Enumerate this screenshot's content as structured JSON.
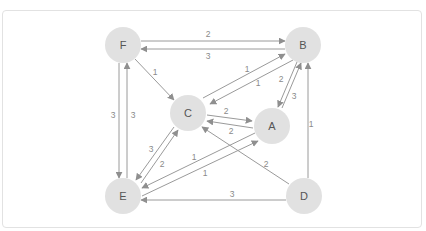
{
  "diagram": {
    "type": "directed-weighted-graph",
    "node_radius": 18,
    "colors": {
      "node_fill": "#e1e1e1",
      "node_text": "#555555",
      "edge": "#9a9a9a",
      "edge_label": "#8a8a8a",
      "card_border": "#e2e2e2"
    },
    "nodes": [
      {
        "id": "F",
        "label": "F",
        "x": 123,
        "y": 45
      },
      {
        "id": "B",
        "label": "B",
        "x": 303,
        "y": 45
      },
      {
        "id": "C",
        "label": "C",
        "x": 188,
        "y": 113
      },
      {
        "id": "A",
        "label": "A",
        "x": 272,
        "y": 126
      },
      {
        "id": "E",
        "label": "E",
        "x": 123,
        "y": 196
      },
      {
        "id": "D",
        "label": "D",
        "x": 304,
        "y": 196
      }
    ],
    "edges": [
      {
        "from": "F",
        "to": "B",
        "weight": "2",
        "x1": 141,
        "y1": 41,
        "x2": 285,
        "y2": 41,
        "lx": 208,
        "ly": 34
      },
      {
        "from": "B",
        "to": "F",
        "weight": "3",
        "x1": 285,
        "y1": 49,
        "x2": 141,
        "y2": 49,
        "lx": 208,
        "ly": 56
      },
      {
        "from": "F",
        "to": "C",
        "weight": "1",
        "x1": 135,
        "y1": 59,
        "x2": 174,
        "y2": 100,
        "lx": 155,
        "ly": 72
      },
      {
        "from": "C",
        "to": "B",
        "weight": "1",
        "x1": 203,
        "y1": 98,
        "x2": 285,
        "y2": 54,
        "lx": 247,
        "ly": 69
      },
      {
        "from": "B",
        "to": "C",
        "weight": "1",
        "x1": 293,
        "y1": 60,
        "x2": 210,
        "y2": 104,
        "lx": 258,
        "ly": 83
      },
      {
        "from": "B",
        "to": "A",
        "weight": "2",
        "x1": 297,
        "y1": 62,
        "x2": 278,
        "y2": 107,
        "lx": 281,
        "ly": 79
      },
      {
        "from": "A",
        "to": "B",
        "weight": "3",
        "x1": 282,
        "y1": 108,
        "x2": 301,
        "y2": 63,
        "lx": 294,
        "ly": 96
      },
      {
        "from": "C",
        "to": "A",
        "weight": "2",
        "x1": 207,
        "y1": 115,
        "x2": 252,
        "y2": 121,
        "lx": 226,
        "ly": 111
      },
      {
        "from": "A",
        "to": "C",
        "weight": "2",
        "x1": 253,
        "y1": 128,
        "x2": 207,
        "y2": 121,
        "lx": 231,
        "ly": 131
      },
      {
        "from": "D",
        "to": "C",
        "weight": "2",
        "x1": 289,
        "y1": 184,
        "x2": 202,
        "y2": 127,
        "lx": 266,
        "ly": 164
      },
      {
        "from": "F",
        "to": "E",
        "weight": "3",
        "x1": 119,
        "y1": 63,
        "x2": 119,
        "y2": 178,
        "lx": 113,
        "ly": 115
      },
      {
        "from": "E",
        "to": "F",
        "weight": "3",
        "x1": 127,
        "y1": 178,
        "x2": 127,
        "y2": 63,
        "lx": 133,
        "ly": 115
      },
      {
        "from": "C",
        "to": "E",
        "weight": "3",
        "x1": 174,
        "y1": 127,
        "x2": 136,
        "y2": 180,
        "lx": 151,
        "ly": 149
      },
      {
        "from": "E",
        "to": "C",
        "weight": "2",
        "x1": 141,
        "y1": 183,
        "x2": 178,
        "y2": 130,
        "lx": 162,
        "ly": 164
      },
      {
        "from": "A",
        "to": "E",
        "weight": "1",
        "x1": 255,
        "y1": 133,
        "x2": 142,
        "y2": 188,
        "lx": 194,
        "ly": 157
      },
      {
        "from": "E",
        "to": "A",
        "weight": "1",
        "x1": 142,
        "y1": 196,
        "x2": 258,
        "y2": 141,
        "lx": 205,
        "ly": 173
      },
      {
        "from": "D",
        "to": "E",
        "weight": "3",
        "x1": 286,
        "y1": 200,
        "x2": 141,
        "y2": 200,
        "lx": 232,
        "ly": 194
      },
      {
        "from": "D",
        "to": "B",
        "weight": "1",
        "x1": 308,
        "y1": 178,
        "x2": 308,
        "y2": 63,
        "lx": 311,
        "ly": 124
      }
    ]
  }
}
